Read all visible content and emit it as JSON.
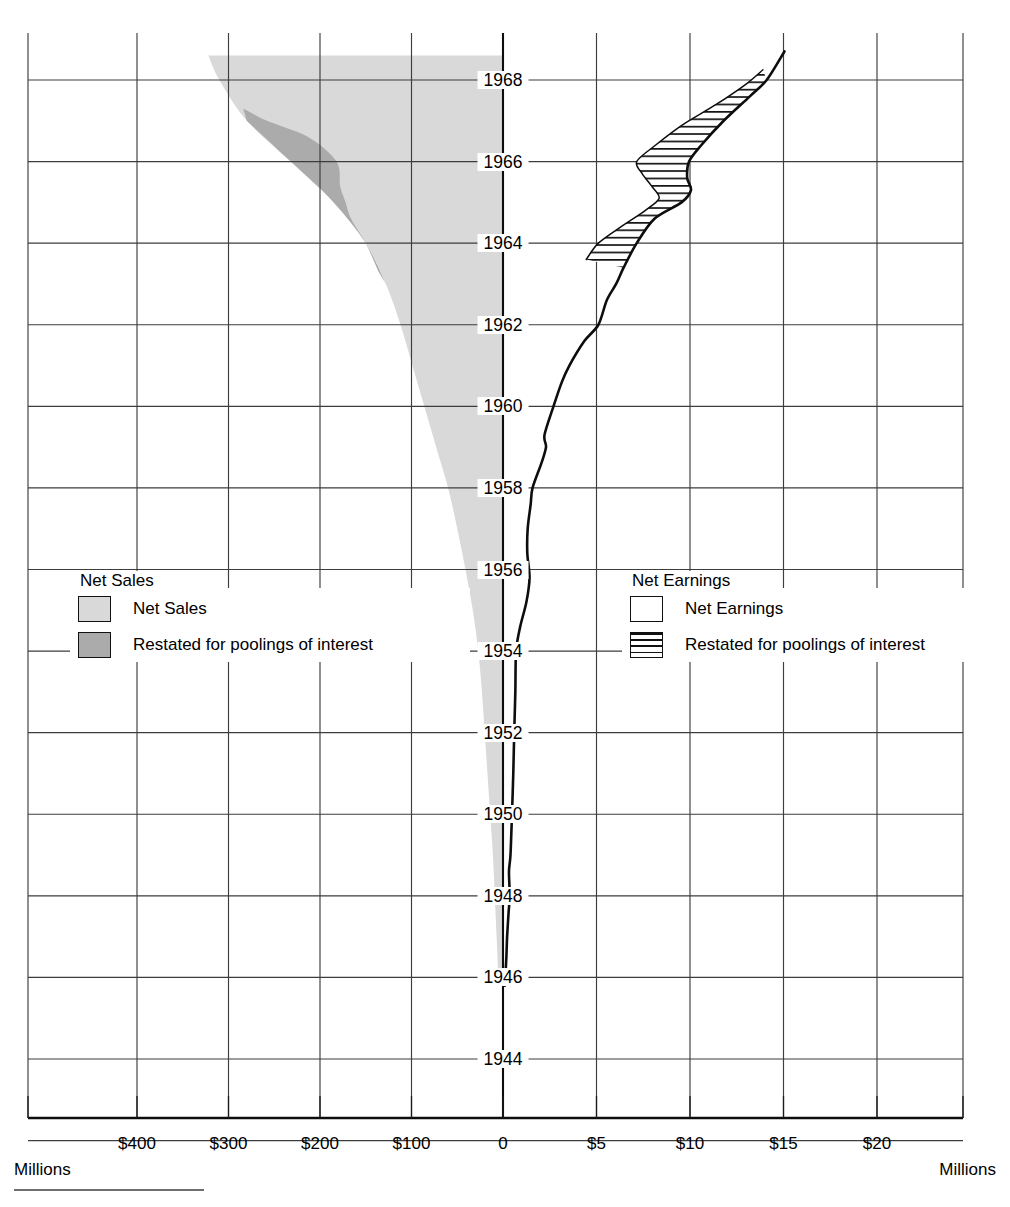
{
  "chart_data": {
    "type": "area",
    "orientation": "horizontal-mirrored",
    "grid": true,
    "ylabel": "Year",
    "y_tick_labels": [
      "1968",
      "1966",
      "1964",
      "1962",
      "1960",
      "1958",
      "1956",
      "1954",
      "1952",
      "1950",
      "1948",
      "1946",
      "1944"
    ],
    "y_values": [
      1968,
      1966,
      1964,
      1962,
      1960,
      1958,
      1956,
      1954,
      1952,
      1950,
      1948,
      1946,
      1944
    ],
    "ylim": [
      1943,
      1968.8
    ],
    "panels": [
      {
        "name": "Net Sales",
        "side": "left",
        "unit_label": "Millions",
        "axis_direction": "right-to-left",
        "xlim": [
          0,
          460
        ],
        "x_tick_labels": [
          "$400",
          "$300",
          "$200",
          "$100",
          "0"
        ],
        "x_tick_values": [
          400,
          300,
          200,
          100,
          0
        ],
        "legend_title": "Net Sales",
        "series": [
          {
            "name": "Net Sales",
            "swatch": "light-gray-filled",
            "color": "#d9d9d9",
            "points": [
              {
                "year": 1946.0,
                "value": 5
              },
              {
                "year": 1947.0,
                "value": 7
              },
              {
                "year": 1948.0,
                "value": 9
              },
              {
                "year": 1949.0,
                "value": 11
              },
              {
                "year": 1950.0,
                "value": 14
              },
              {
                "year": 1951.0,
                "value": 17
              },
              {
                "year": 1952.0,
                "value": 20
              },
              {
                "year": 1953.0,
                "value": 23
              },
              {
                "year": 1954.0,
                "value": 27
              },
              {
                "year": 1955.0,
                "value": 33
              },
              {
                "year": 1956.0,
                "value": 41
              },
              {
                "year": 1957.0,
                "value": 50
              },
              {
                "year": 1958.0,
                "value": 60
              },
              {
                "year": 1959.0,
                "value": 73
              },
              {
                "year": 1960.0,
                "value": 86
              },
              {
                "year": 1961.0,
                "value": 99
              },
              {
                "year": 1962.0,
                "value": 112
              },
              {
                "year": 1963.0,
                "value": 128
              },
              {
                "year": 1964.0,
                "value": 150
              },
              {
                "year": 1965.0,
                "value": 185
              },
              {
                "year": 1966.0,
                "value": 232
              },
              {
                "year": 1967.0,
                "value": 280
              },
              {
                "year": 1968.0,
                "value": 310
              },
              {
                "year": 1968.6,
                "value": 322
              }
            ]
          },
          {
            "name": "Restated for poolings of interest",
            "swatch": "dark-gray-filled",
            "color": "#ababab",
            "inner_points": [
              {
                "year": 1963.3,
                "value": 136
              },
              {
                "year": 1964.0,
                "value": 150
              },
              {
                "year": 1964.6,
                "value": 166
              },
              {
                "year": 1965.0,
                "value": 172
              },
              {
                "year": 1965.4,
                "value": 178
              },
              {
                "year": 1966.0,
                "value": 182
              },
              {
                "year": 1966.6,
                "value": 213
              },
              {
                "year": 1967.0,
                "value": 258
              },
              {
                "year": 1967.3,
                "value": 284
              }
            ]
          }
        ]
      },
      {
        "name": "Net Earnings",
        "side": "right",
        "unit_label": "Millions",
        "axis_direction": "left-to-right",
        "xlim": [
          0,
          25
        ],
        "x_tick_labels": [
          "$5",
          "$10",
          "$15",
          "$20"
        ],
        "x_tick_values": [
          5,
          10,
          15,
          20
        ],
        "legend_title": "Net Earnings",
        "series": [
          {
            "name": "Net Earnings",
            "swatch": "white-outline",
            "color": "#ffffff",
            "points": [
              {
                "year": 1945.8,
                "value": 0.1
              },
              {
                "year": 1946.5,
                "value": 0.18
              },
              {
                "year": 1947.0,
                "value": 0.22
              },
              {
                "year": 1947.6,
                "value": 0.3
              },
              {
                "year": 1948.0,
                "value": 0.36
              },
              {
                "year": 1948.6,
                "value": 0.32
              },
              {
                "year": 1949.0,
                "value": 0.4
              },
              {
                "year": 1950.0,
                "value": 0.48
              },
              {
                "year": 1951.0,
                "value": 0.55
              },
              {
                "year": 1952.0,
                "value": 0.6
              },
              {
                "year": 1953.0,
                "value": 0.66
              },
              {
                "year": 1954.0,
                "value": 0.7
              },
              {
                "year": 1954.6,
                "value": 0.92
              },
              {
                "year": 1955.2,
                "value": 1.25
              },
              {
                "year": 1955.8,
                "value": 1.42
              },
              {
                "year": 1956.4,
                "value": 1.3
              },
              {
                "year": 1957.0,
                "value": 1.32
              },
              {
                "year": 1957.6,
                "value": 1.48
              },
              {
                "year": 1958.0,
                "value": 1.58
              },
              {
                "year": 1958.6,
                "value": 2.05
              },
              {
                "year": 1959.0,
                "value": 2.3
              },
              {
                "year": 1959.3,
                "value": 2.22
              },
              {
                "year": 1960.0,
                "value": 2.7
              },
              {
                "year": 1960.6,
                "value": 3.15
              },
              {
                "year": 1961.0,
                "value": 3.55
              },
              {
                "year": 1961.6,
                "value": 4.35
              },
              {
                "year": 1962.0,
                "value": 5.1
              },
              {
                "year": 1962.6,
                "value": 5.55
              },
              {
                "year": 1963.0,
                "value": 6.05
              },
              {
                "year": 1963.4,
                "value": 6.45
              },
              {
                "year": 1964.0,
                "value": 7.15
              },
              {
                "year": 1964.6,
                "value": 8.1
              },
              {
                "year": 1965.0,
                "value": 9.55
              },
              {
                "year": 1965.3,
                "value": 10.05
              },
              {
                "year": 1965.6,
                "value": 9.85
              },
              {
                "year": 1966.0,
                "value": 9.95
              },
              {
                "year": 1966.4,
                "value": 10.6
              },
              {
                "year": 1967.0,
                "value": 11.8
              },
              {
                "year": 1967.6,
                "value": 13.2
              },
              {
                "year": 1968.0,
                "value": 14.1
              },
              {
                "year": 1968.7,
                "value": 15.05
              }
            ]
          },
          {
            "name": "Restated for poolings of interest",
            "swatch": "horizontal-hatch",
            "color": "#111111",
            "inner_points": [
              {
                "year": 1963.6,
                "value": 4.45
              },
              {
                "year": 1964.0,
                "value": 5.1
              },
              {
                "year": 1964.4,
                "value": 6.3
              },
              {
                "year": 1964.8,
                "value": 7.6
              },
              {
                "year": 1965.1,
                "value": 8.35
              },
              {
                "year": 1965.4,
                "value": 7.95
              },
              {
                "year": 1965.7,
                "value": 7.45
              },
              {
                "year": 1966.0,
                "value": 7.15
              },
              {
                "year": 1966.4,
                "value": 8.15
              },
              {
                "year": 1966.9,
                "value": 9.6
              },
              {
                "year": 1967.4,
                "value": 11.4
              },
              {
                "year": 1967.9,
                "value": 13.0
              },
              {
                "year": 1968.25,
                "value": 13.9
              }
            ]
          }
        ]
      }
    ]
  },
  "axes": {
    "left": {
      "unit": "Millions",
      "ticks": [
        {
          "label": "$400"
        },
        {
          "label": "$300"
        },
        {
          "label": "$200"
        },
        {
          "label": "$100"
        },
        {
          "label": "0"
        }
      ]
    },
    "right": {
      "unit": "Millions",
      "ticks": [
        {
          "label": "$5"
        },
        {
          "label": "$10"
        },
        {
          "label": "$15"
        },
        {
          "label": "$20"
        }
      ]
    },
    "years": [
      "1968",
      "1966",
      "1964",
      "1962",
      "1960",
      "1958",
      "1956",
      "1954",
      "1952",
      "1950",
      "1948",
      "1946",
      "1944"
    ]
  },
  "legends": {
    "sales": {
      "title": "Net Sales",
      "items": [
        {
          "label": "Net Sales",
          "swatch": "light"
        },
        {
          "label": "Restated for poolings of interest",
          "swatch": "dark"
        }
      ]
    },
    "earnings": {
      "title": "Net Earnings",
      "items": [
        {
          "label": "Net Earnings",
          "swatch": "plain"
        },
        {
          "label": "Restated for poolings of interest",
          "swatch": "hatch"
        }
      ]
    }
  },
  "colors": {
    "sales_light": "#d9d9d9",
    "sales_dark": "#ababab",
    "grid": "#444444",
    "axis": "#111111",
    "ink": "#000000"
  }
}
